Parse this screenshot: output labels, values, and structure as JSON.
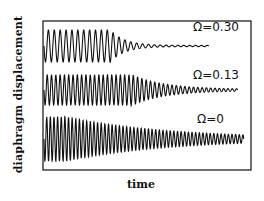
{
  "chart_data": {
    "type": "line",
    "title": "",
    "xlabel": "time",
    "ylabel": "diaphragm  displacement",
    "grid": false,
    "legend": null,
    "axis_ticks": "none",
    "series": [
      {
        "name": "Ω=0.30",
        "label": "Ω=0.30",
        "description": "large oscillation that decays quickly to near zero",
        "baseline_y": 46,
        "amplitude": 16,
        "decay_start_frac": 0.4,
        "end_frac": 0.8,
        "cycles": 28
      },
      {
        "name": "Ω=0.13",
        "label": "Ω=0.13",
        "description": "large oscillation decaying more slowly",
        "baseline_y": 90,
        "amplitude": 15,
        "decay_start_frac": 0.45,
        "end_frac": 0.94,
        "cycles": 45
      },
      {
        "name": "Ω=0",
        "label": "Ω=0",
        "description": "large oscillation with slow gradual decay",
        "baseline_y": 139,
        "amplitude": 22,
        "decay_start_frac": 0.1,
        "end_frac": 0.97,
        "cycles": 55
      }
    ]
  },
  "labels": {
    "y_axis": "diaphragm  displacement",
    "x_axis": "time",
    "s1": "Ω=0.30",
    "s2": "Ω=0.13",
    "s3": "Ω=0"
  }
}
